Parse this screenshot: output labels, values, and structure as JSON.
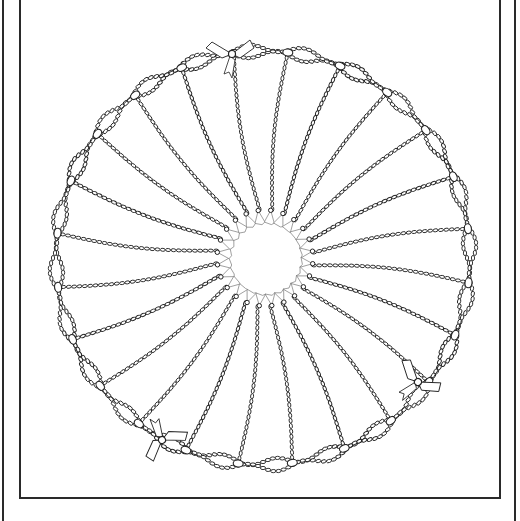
{
  "illustration": {
    "subject": "circular beaded chain wreath with ribbon bows and spokes radiating to a central hub",
    "ink_color": "#222222",
    "paper_color": "#ffffff",
    "ring": {
      "cx": 263,
      "cy": 258,
      "r": 207,
      "strands": 2,
      "strand_gap": 6
    },
    "hub": {
      "cx": 265,
      "cy": 258,
      "r": 38
    },
    "spoke_count": 24,
    "bows": [
      {
        "x": 232,
        "y": 54,
        "angle": 0
      },
      {
        "x": 418,
        "y": 382,
        "angle": 40
      },
      {
        "x": 162,
        "y": 440,
        "angle": 150
      }
    ]
  },
  "frame": {
    "outer_color": "#2a2a2a",
    "inner_color": "#2a2a2a"
  }
}
